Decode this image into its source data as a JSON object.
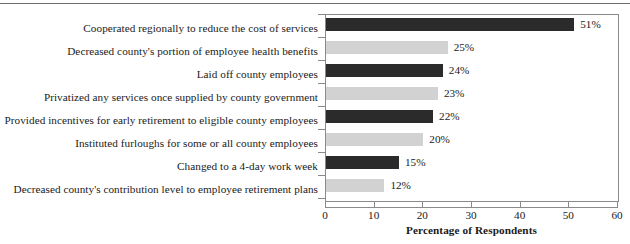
{
  "chart_data": {
    "type": "bar",
    "orientation": "horizontal",
    "title": "",
    "xlabel": "Percentage of Respondents",
    "ylabel": "",
    "xlim": [
      0,
      60
    ],
    "xticks": [
      0,
      10,
      20,
      30,
      40,
      50,
      60
    ],
    "grid": false,
    "legend": null,
    "value_suffix": "%",
    "categories": [
      "Cooperated regionally to reduce the cost of services",
      "Decreased county's portion of employee health benefits",
      "Laid off county employees",
      "Privatized any services once supplied by county government",
      "Provided incentives for early retirement to eligible county employees",
      "Instituted furloughs for some or all county employees",
      "Changed to a 4-day work week",
      "Decreased county's contribution level to employee retirement plans"
    ],
    "values": [
      51,
      25,
      24,
      23,
      22,
      20,
      15,
      12
    ],
    "value_labels": [
      "51%",
      "25%",
      "24%",
      "23%",
      "22%",
      "20%",
      "15%",
      "12%"
    ],
    "bar_colors": [
      "#2b2b2b",
      "#d2d2d2",
      "#2b2b2b",
      "#d2d2d2",
      "#2b2b2b",
      "#d2d2d2",
      "#2b2b2b",
      "#d2d2d2"
    ],
    "colors": {
      "dark_bar": "#2b2b2b",
      "light_bar": "#d2d2d2",
      "axis": "#8a8a8a",
      "text": "#1a1a1a",
      "rule": "#6d6d6d",
      "background": "#ffffff"
    }
  },
  "xtick_labels": [
    "0",
    "10",
    "20",
    "30",
    "40",
    "50",
    "60"
  ]
}
